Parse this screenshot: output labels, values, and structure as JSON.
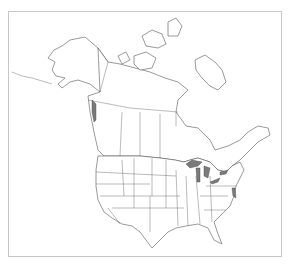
{
  "map": {
    "type": "outline-map",
    "region": "North America",
    "countries": [
      "Canada",
      "United States"
    ],
    "style": {
      "background": "#ffffff",
      "frame_color": "#c8c8c8",
      "outline_color": "#555555",
      "water_fill": "#7a7a7a"
    },
    "features": [
      "state-borders",
      "province-borders",
      "great-lakes",
      "arctic-archipelago",
      "alaska",
      "florida"
    ],
    "labels": []
  }
}
